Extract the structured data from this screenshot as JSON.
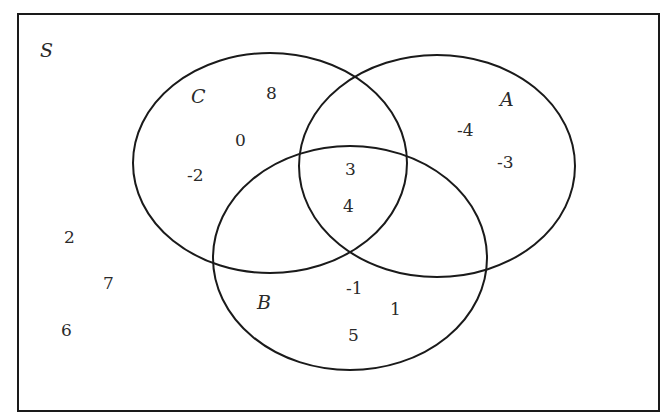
{
  "diagram": {
    "type": "venn",
    "universe": {
      "label": "S",
      "outside_elements": [
        "2",
        "7",
        "6"
      ]
    },
    "sets": [
      {
        "name": "C",
        "only": [
          "8",
          "0",
          "-2"
        ]
      },
      {
        "name": "A",
        "only": [
          "-4",
          "-3"
        ]
      },
      {
        "name": "B",
        "only": [
          "-1",
          "1",
          "5"
        ]
      }
    ],
    "intersections": {
      "A_and_C_and_B": [
        "3",
        "4"
      ],
      "A_and_C_only": [],
      "A_and_B_only": [],
      "B_and_C_only": []
    },
    "colors": {
      "stroke": "#1a1a1a",
      "text": "#2a2a2a",
      "background": "#ffffff"
    }
  }
}
